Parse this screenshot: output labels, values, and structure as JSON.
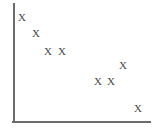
{
  "chart_data": {
    "type": "scatter",
    "title": "",
    "subtitle": "",
    "xlabel": "",
    "ylabel": "",
    "xlim": [
      0,
      100
    ],
    "ylim": [
      0,
      100
    ],
    "grid": false,
    "legend": null,
    "marker_glyph": "X",
    "marker_color": "#4a4a4a",
    "axis_color": "#6b6b6b",
    "background_color": "#ffffff",
    "xticks": [],
    "yticks": [],
    "xticklabels": [],
    "yticklabels": [],
    "annotations": [],
    "series": [
      {
        "name": "",
        "marker": "X",
        "points": [
          {
            "label": "X",
            "x": 7,
            "y": 89,
            "px": 22,
            "py": 17
          },
          {
            "label": "X",
            "x": 16,
            "y": 75,
            "px": 36,
            "py": 33
          },
          {
            "label": "X",
            "x": 25,
            "y": 60,
            "px": 48,
            "py": 51
          },
          {
            "label": "X",
            "x": 35,
            "y": 60,
            "px": 62,
            "py": 51
          },
          {
            "label": "X",
            "x": 80,
            "y": 48,
            "px": 123,
            "py": 65
          },
          {
            "label": "X",
            "x": 62,
            "y": 35,
            "px": 98,
            "py": 81
          },
          {
            "label": "X",
            "x": 71,
            "y": 35,
            "px": 111,
            "py": 81
          },
          {
            "label": "X",
            "x": 91,
            "y": 12,
            "px": 138,
            "py": 108
          }
        ]
      }
    ],
    "axes_geometry": {
      "y_axis": {
        "x1": 14,
        "y1": 4,
        "x2": 14,
        "y2": 122
      },
      "x_axis": {
        "x1": 14,
        "y1": 122,
        "x2": 150,
        "y2": 122
      }
    }
  }
}
